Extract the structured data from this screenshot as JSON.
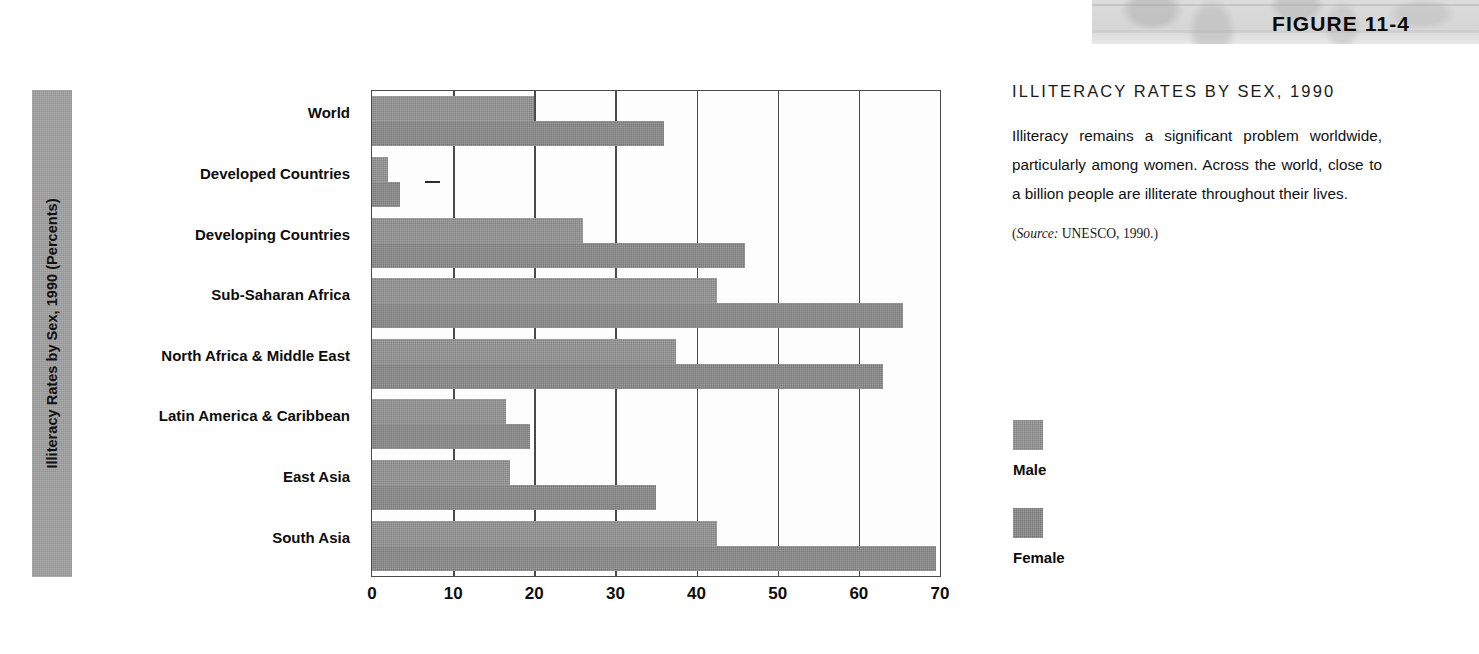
{
  "figure": {
    "number_label": "FIGURE 11-4"
  },
  "caption": {
    "title": "ILLITERACY RATES BY SEX, 1990",
    "body": "Illiteracy remains a significant problem worldwide, particularly among women. Across the world, close to a billion people are illiterate throughout their lives.",
    "source_open": "(",
    "source_italic": "Source:",
    "source_rest": " UNESCO, 1990.)"
  },
  "legend": {
    "items": [
      {
        "label": "Male",
        "color": "#8f8f8f"
      },
      {
        "label": "Female",
        "color": "#858585"
      }
    ]
  },
  "axis": {
    "y_title": "Illiteracy Rates by Sex, 1990 (Percents)",
    "y_title_band_color": "#9e9e9e"
  },
  "chart_data": {
    "type": "bar",
    "orientation": "horizontal",
    "title": "ILLITERACY RATES BY SEX, 1990",
    "xlabel": "",
    "ylabel": "Illiteracy Rates by Sex, 1990 (Percents)",
    "xlim": [
      0,
      70
    ],
    "xticks": [
      0,
      10,
      20,
      30,
      40,
      50,
      60,
      70
    ],
    "xtick_labels": [
      "0",
      "10",
      "20",
      "30",
      "40",
      "50",
      "60",
      "70"
    ],
    "grid": "vertical",
    "legend_position": "right",
    "categories": [
      "World",
      "Developed Countries",
      "Developing Countries",
      "Sub-Saharan Africa",
      "North Africa & Middle East",
      "Latin America & Caribbean",
      "East Asia",
      "South Asia"
    ],
    "series": [
      {
        "name": "Male",
        "color": "#8f8f8f",
        "values": [
          20,
          2,
          26,
          42.5,
          37.5,
          16.5,
          17,
          42.5
        ]
      },
      {
        "name": "Female",
        "color": "#858585",
        "values": [
          36,
          3.5,
          46,
          65.5,
          63,
          19.5,
          35,
          69.5
        ]
      }
    ],
    "annotations": [
      "(Source: UNESCO, 1990.)"
    ]
  }
}
